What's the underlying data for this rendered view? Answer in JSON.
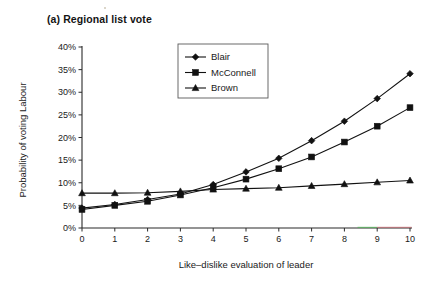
{
  "figure": {
    "panel_label": "(a) Regional list vote"
  },
  "chart_data": {
    "type": "line",
    "title": "(a) Regional list vote",
    "xlabel": "Like–dislike evaluation of leader",
    "ylabel": "Probability of voting Labour",
    "x": [
      0,
      1,
      2,
      3,
      4,
      5,
      6,
      7,
      8,
      9,
      10
    ],
    "xtick_labels": [
      "0",
      "1",
      "2",
      "3",
      "4",
      "5",
      "6",
      "7",
      "8",
      "9",
      "10"
    ],
    "ytick_labels": [
      "0%",
      "5%",
      "10%",
      "15%",
      "20%",
      "25%",
      "30%",
      "35%",
      "40%"
    ],
    "ytick_values": [
      0,
      5,
      10,
      15,
      20,
      25,
      30,
      35,
      40
    ],
    "xlim": [
      0,
      10
    ],
    "ylim": [
      0,
      40
    ],
    "grid": false,
    "legend_position": "top-center",
    "series": [
      {
        "name": "Blair",
        "marker": "diamond",
        "color": "#111111",
        "values": [
          4.4,
          5.2,
          6.3,
          7.5,
          9.6,
          12.4,
          15.4,
          19.3,
          23.6,
          28.6,
          34.1
        ]
      },
      {
        "name": "McConnell",
        "marker": "square",
        "color": "#111111",
        "values": [
          4.1,
          5.0,
          5.9,
          7.3,
          8.9,
          10.8,
          13.1,
          15.7,
          19.0,
          22.5,
          26.6
        ]
      },
      {
        "name": "Brown",
        "marker": "triangle",
        "color": "#111111",
        "values": [
          7.7,
          7.7,
          7.8,
          8.1,
          8.5,
          8.7,
          8.9,
          9.3,
          9.7,
          10.1,
          10.5
        ]
      }
    ]
  },
  "scan_artifact": {
    "green": "#56b05a",
    "red": "#c9636b"
  }
}
